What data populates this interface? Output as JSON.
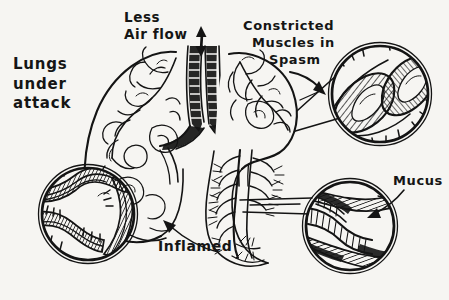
{
  "illustration": {
    "title": "Lungs under attack — asthma attack anatomy sketch",
    "style": "hand-drawn black ink sketch on off-white paper",
    "ink_color": "#141414",
    "paper_color": "#f6f5f2"
  },
  "labels": {
    "lungs_under_attack": "Lungs\nunder\nattack",
    "less_air_flow": "Less\nAir flow",
    "constricted_line1": "Constricted",
    "constricted_line2": "Muscles in",
    "constricted_line3": "Spasm",
    "inflamed": "Inflamed",
    "mucus": "Mucus"
  },
  "icons": {
    "airflow_arrow": "double-headed-vertical-arrow",
    "spasm_arrow": "arrow-pointing-right-down",
    "inflamed_arrow": "arrow-pointing-up-left",
    "mucus_arrow": "curved-arrow-pointing-down-left"
  },
  "anatomy": {
    "left_lung": "left lung outline with bronchial tree",
    "right_lung": "right lung outline with dense bronchial tree",
    "trachea": "inflamed narrowed trachea, heavily inked",
    "bifurcation": "carina splitting into two main bronchi"
  },
  "magnifiers": [
    {
      "name": "constricted-muscles-detail",
      "position": "top-right",
      "center": [
        380,
        94
      ],
      "radius": 50,
      "depicts": "airway squeezed by bands of smooth muscle in spasm"
    },
    {
      "name": "inflamed-airway-detail",
      "position": "bottom-left",
      "center": [
        88,
        214
      ],
      "radius": 48,
      "depicts": "airway lining thickened and swollen by inflammation"
    },
    {
      "name": "mucus-plug-detail",
      "position": "bottom-right",
      "center": [
        350,
        226
      ],
      "radius": 46,
      "depicts": "airway lumen clogged with thick mucus"
    }
  ]
}
